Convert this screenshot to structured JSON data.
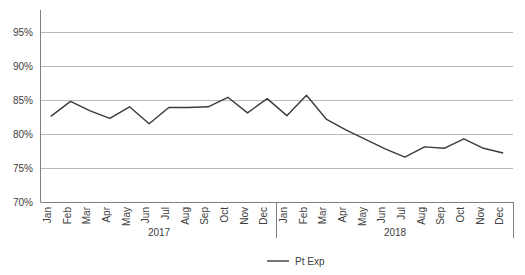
{
  "chart_data": {
    "type": "line",
    "title": "",
    "xlabel": "",
    "ylabel": "",
    "ylim": [
      70,
      97
    ],
    "grid": true,
    "legend_position": "bottom",
    "y_ticks": [
      "70%",
      "75%",
      "80%",
      "85%",
      "90%",
      "95%"
    ],
    "y_tick_values": [
      70,
      75,
      80,
      85,
      90,
      95
    ],
    "categories": [
      "Jan",
      "Feb",
      "Mar",
      "Apr",
      "May",
      "Jun",
      "Jul",
      "Aug",
      "Sep",
      "Oct",
      "Nov",
      "Dec",
      "Jan",
      "Feb",
      "Mar",
      "Apr",
      "May",
      "Jun",
      "Jul",
      "Aug",
      "Sep",
      "Oct",
      "Nov",
      "Dec"
    ],
    "group_labels": [
      "2017",
      "2018"
    ],
    "series": [
      {
        "name": "Pt Exp",
        "color": "#3b3b3b",
        "values": [
          82.6,
          84.8,
          83.4,
          82.3,
          84.0,
          81.5,
          83.9,
          83.9,
          84.0,
          85.4,
          83.1,
          85.2,
          82.7,
          85.7,
          82.2,
          80.6,
          79.2,
          77.8,
          76.6,
          78.1,
          77.9,
          79.3,
          77.9,
          77.2
        ]
      }
    ],
    "legend": [
      {
        "label": "Pt Exp",
        "color": "#3b3b3b"
      }
    ]
  }
}
